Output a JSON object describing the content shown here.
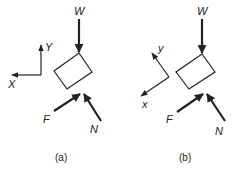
{
  "panels": [
    {
      "id": "a",
      "caption": "(a)",
      "axes": {
        "horizontal": "X",
        "vertical": "Y"
      },
      "forces": {
        "weight": "W",
        "friction": "F",
        "normal": "N"
      }
    },
    {
      "id": "b",
      "caption": "(b)",
      "axes": {
        "horizontal": "x",
        "vertical": "y"
      },
      "forces": {
        "weight": "W",
        "friction": "F",
        "normal": "N"
      }
    }
  ],
  "colors": {
    "stroke": "#222222",
    "background": "#ffffff"
  }
}
